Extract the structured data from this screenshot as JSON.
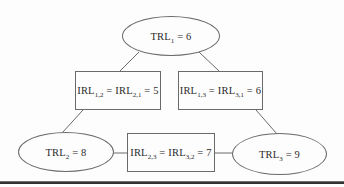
{
  "figure": {
    "colors": {
      "background": "#fdfdfd",
      "outline": "#6a6a6a",
      "text": "#2b2b2b",
      "bottom_rule": "#2e2e2e"
    },
    "nodes": {
      "trl1": {
        "shape": "ellipse",
        "parts": [
          "TRL",
          "1",
          " = 6"
        ]
      },
      "irl12": {
        "shape": "rectangle",
        "parts": [
          "IRL",
          "1,2",
          " = IRL",
          "2,1",
          " = 5"
        ]
      },
      "irl13": {
        "shape": "rectangle",
        "parts": [
          "IRL",
          "1,3",
          " = IRL",
          "3,1",
          " = 6"
        ]
      },
      "trl2": {
        "shape": "ellipse",
        "parts": [
          "TRL",
          "2",
          " = 8"
        ]
      },
      "irl23": {
        "shape": "rectangle",
        "parts": [
          "IRL",
          "2,3",
          " = IRL",
          "3,2",
          " = 7"
        ]
      },
      "trl3": {
        "shape": "ellipse",
        "parts": [
          "TRL",
          "3",
          " = 9"
        ]
      }
    },
    "edges": [
      {
        "from": "trl1",
        "to": "irl12"
      },
      {
        "from": "trl1",
        "to": "irl13"
      },
      {
        "from": "irl12",
        "to": "trl2"
      },
      {
        "from": "irl13",
        "to": "trl3"
      },
      {
        "from": "trl2",
        "to": "irl23"
      },
      {
        "from": "irl23",
        "to": "trl3"
      }
    ]
  }
}
